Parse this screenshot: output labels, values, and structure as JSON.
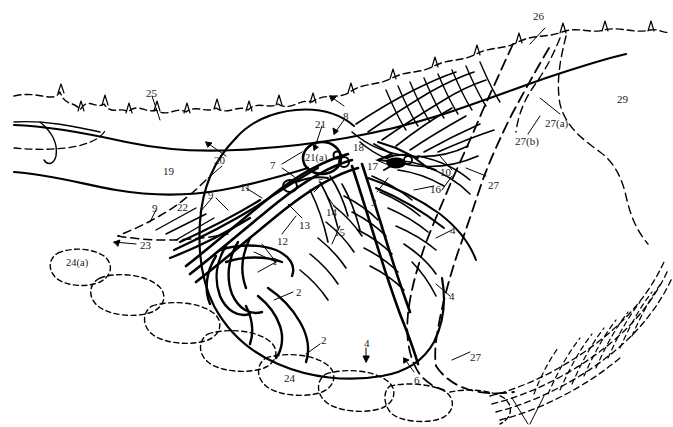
{
  "figure": {
    "type": "patent-style-line-diagram",
    "background_color": "#ffffff",
    "line_color": "#000000",
    "width": 673,
    "height": 427
  },
  "labels": [
    {
      "id": "l-25",
      "text": "25",
      "x": 146,
      "y": 88
    },
    {
      "id": "l-26",
      "text": "26",
      "x": 533,
      "y": 11
    },
    {
      "id": "l-29",
      "text": "29",
      "x": 617,
      "y": 94
    },
    {
      "id": "l-27a",
      "text": "27(a)",
      "x": 545,
      "y": 118
    },
    {
      "id": "l-27b",
      "text": "27(b)",
      "x": 515,
      "y": 136
    },
    {
      "id": "l-27-r",
      "text": "27",
      "x": 488,
      "y": 180
    },
    {
      "id": "l-27-b2",
      "text": "27",
      "x": 470,
      "y": 352
    },
    {
      "id": "l-8",
      "text": "8",
      "x": 343,
      "y": 111
    },
    {
      "id": "l-21",
      "text": "21",
      "x": 315,
      "y": 119
    },
    {
      "id": "l-18",
      "text": "18",
      "x": 353,
      "y": 142
    },
    {
      "id": "l-21a",
      "text": "21(a)",
      "x": 305,
      "y": 156
    },
    {
      "id": "l-17",
      "text": "17",
      "x": 367,
      "y": 161
    },
    {
      "id": "l-10",
      "text": "10",
      "x": 440,
      "y": 167
    },
    {
      "id": "l-16",
      "text": "16",
      "x": 430,
      "y": 184
    },
    {
      "id": "l-5",
      "text": "5",
      "x": 318,
      "y": 177
    },
    {
      "id": "l-3",
      "text": "3",
      "x": 371,
      "y": 197
    },
    {
      "id": "l-7",
      "text": "7",
      "x": 270,
      "y": 164
    },
    {
      "id": "l-19",
      "text": "19",
      "x": 163,
      "y": 166
    },
    {
      "id": "l-20",
      "text": "20",
      "x": 214,
      "y": 158
    },
    {
      "id": "l-11",
      "text": "11",
      "x": 240,
      "y": 184
    },
    {
      "id": "l-9a",
      "text": "9",
      "x": 208,
      "y": 193
    },
    {
      "id": "l-9b",
      "text": "9",
      "x": 152,
      "y": 204
    },
    {
      "id": "l-22",
      "text": "22",
      "x": 177,
      "y": 204
    },
    {
      "id": "l-13",
      "text": "13",
      "x": 299,
      "y": 222
    },
    {
      "id": "l-12",
      "text": "12",
      "x": 277,
      "y": 238
    },
    {
      "id": "l-14",
      "text": "14",
      "x": 326,
      "y": 209
    },
    {
      "id": "l-15",
      "text": "15",
      "x": 334,
      "y": 229
    },
    {
      "id": "l-4a",
      "text": "4",
      "x": 448,
      "y": 227
    },
    {
      "id": "l-4b",
      "text": "4",
      "x": 447,
      "y": 293
    },
    {
      "id": "l-4c",
      "text": "4",
      "x": 364,
      "y": 342
    },
    {
      "id": "l-23",
      "text": "23",
      "x": 140,
      "y": 243
    },
    {
      "id": "l-24a",
      "text": "24(a)",
      "x": 68,
      "y": 261
    },
    {
      "id": "l-24",
      "text": "24",
      "x": 284,
      "y": 375
    },
    {
      "id": "l-1a",
      "text": "1",
      "x": 271,
      "y": 258
    },
    {
      "id": "l-2a",
      "text": "2",
      "x": 295,
      "y": 289
    },
    {
      "id": "l-2b",
      "text": "2",
      "x": 321,
      "y": 338
    },
    {
      "id": "l-6",
      "text": "6",
      "x": 414,
      "y": 377
    }
  ]
}
